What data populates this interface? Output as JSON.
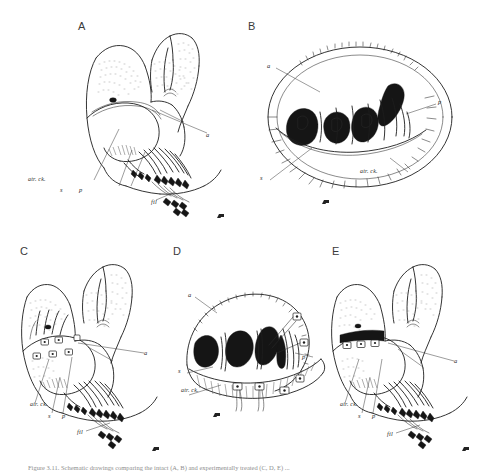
{
  "figure": {
    "kind": "scientific-line-drawing-plate",
    "background_color": "#ffffff",
    "ink_color": "#1d1d1d",
    "label_color": "#2b2b2b",
    "panel_count": 5,
    "caption": "Figure 3.11. Schematic drawings comparing the intact (A, B) and experimentally treated (C, D, E) ..."
  },
  "panels": [
    {
      "id": "A",
      "letter": "A",
      "view": "lateral whole-mount, untreated",
      "labels": [
        {
          "key": "a",
          "text": "a"
        },
        {
          "key": "atr_ck",
          "text": "atr. ck."
        },
        {
          "key": "s",
          "text": "s"
        },
        {
          "key": "p",
          "text": "p"
        },
        {
          "key": "fil",
          "text": "fil"
        }
      ],
      "electrodes": 0
    },
    {
      "id": "B",
      "letter": "B",
      "view": "transverse section, untreated",
      "labels": [
        {
          "key": "a",
          "text": "a"
        },
        {
          "key": "p",
          "text": "p"
        },
        {
          "key": "s",
          "text": "s"
        },
        {
          "key": "atr_ck",
          "text": "atr. ck."
        }
      ],
      "electrodes": 0
    },
    {
      "id": "C",
      "letter": "C",
      "view": "lateral whole-mount with markers",
      "labels": [
        {
          "key": "a",
          "text": "a"
        },
        {
          "key": "atr_ck",
          "text": "atr. ck."
        },
        {
          "key": "s",
          "text": "s"
        },
        {
          "key": "p",
          "text": "p"
        },
        {
          "key": "fil",
          "text": "fil"
        }
      ],
      "electrodes": 6
    },
    {
      "id": "D",
      "letter": "D",
      "view": "transverse section with markers",
      "labels": [
        {
          "key": "a",
          "text": "a"
        },
        {
          "key": "p",
          "text": "p"
        },
        {
          "key": "s",
          "text": "s"
        },
        {
          "key": "atr_ck",
          "text": "atr. ck."
        }
      ],
      "electrodes": 6
    },
    {
      "id": "E",
      "letter": "E",
      "view": "lateral whole-mount with markers",
      "labels": [
        {
          "key": "a",
          "text": "a"
        },
        {
          "key": "atr_ck",
          "text": "atr. ck."
        },
        {
          "key": "s",
          "text": "s"
        },
        {
          "key": "p",
          "text": "p"
        },
        {
          "key": "fil",
          "text": "fil"
        }
      ],
      "electrodes": 3
    }
  ]
}
